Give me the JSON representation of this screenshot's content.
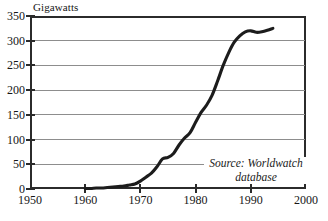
{
  "chart_data": {
    "type": "line",
    "title": "",
    "subtitle": "",
    "xlabel": "",
    "ylabel": "Gigawatts",
    "xlim": [
      1950,
      2000
    ],
    "ylim": [
      0,
      350
    ],
    "grid": true,
    "legend_position": "none",
    "x_ticks": [
      "1950",
      "1960",
      "1970",
      "1980",
      "1990",
      "2000"
    ],
    "y_ticks": [
      "0",
      "50",
      "100",
      "150",
      "200",
      "250",
      "300",
      "350"
    ],
    "annotations": [
      {
        "text_line_1": "Source: Worldwatch",
        "text_line_2": "database"
      }
    ],
    "series": [
      {
        "name": "World Nuclear Generating Capacity",
        "x": [
          1960,
          1961,
          1962,
          1963,
          1964,
          1965,
          1966,
          1967,
          1968,
          1969,
          1970,
          1971,
          1972,
          1973,
          1974,
          1975,
          1976,
          1977,
          1978,
          1979,
          1980,
          1981,
          1982,
          1983,
          1984,
          1985,
          1986,
          1987,
          1988,
          1989,
          1990,
          1991,
          1992,
          1993,
          1994
        ],
        "y": [
          1,
          1,
          2,
          2,
          3,
          4,
          5,
          6,
          8,
          10,
          16,
          24,
          32,
          45,
          61,
          64,
          72,
          89,
          103,
          114,
          135,
          155,
          170,
          190,
          219,
          250,
          276,
          297,
          310,
          318,
          320,
          317,
          318,
          321,
          325
        ]
      }
    ]
  },
  "ylabel_caption": "Gigawatts",
  "source": {
    "line_1": "Source: Worldwatch",
    "line_2": "database"
  },
  "colors": {
    "series_line": "#1c1c1c",
    "gridline": "#8d8d8d",
    "axis": "#2b2b2b",
    "background": "#ffffff",
    "text": "#161616"
  }
}
